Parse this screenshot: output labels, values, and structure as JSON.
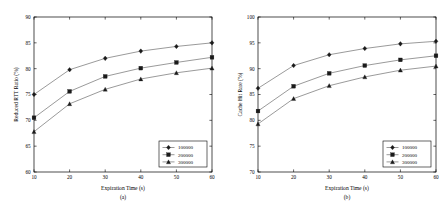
{
  "figure": {
    "panel_count": 2,
    "background": "#ffffff",
    "line_color": "#555555",
    "marker_color": "#1a1a1a",
    "axis_color": "#000000"
  },
  "chart_data": [
    {
      "type": "line",
      "panel_id": "a",
      "subcaption": "(a)",
      "title": "",
      "xlabel": "Expiration Time (s)",
      "ylabel": "Reduced RTT Ratio (%)",
      "x": [
        10,
        20,
        30,
        40,
        50,
        60
      ],
      "xticks": [
        "10",
        "20",
        "30",
        "40",
        "50",
        "60"
      ],
      "yticks": [
        "60",
        "65",
        "70",
        "75",
        "80",
        "85",
        "90"
      ],
      "xlim": [
        10,
        60
      ],
      "ylim": [
        60,
        90
      ],
      "grid": false,
      "legend_position": "lower right",
      "series": [
        {
          "name": "100000",
          "marker": "diamond",
          "values": [
            75.0,
            79.8,
            82.0,
            83.4,
            84.3,
            85.0
          ]
        },
        {
          "name": "200000",
          "marker": "square",
          "values": [
            70.5,
            75.6,
            78.5,
            80.1,
            81.2,
            82.2
          ]
        },
        {
          "name": "300000",
          "marker": "triangle",
          "values": [
            67.8,
            73.2,
            76.0,
            78.0,
            79.2,
            80.1
          ]
        }
      ]
    },
    {
      "type": "line",
      "panel_id": "b",
      "subcaption": "(b)",
      "title": "",
      "xlabel": "Expiration Time (s)",
      "ylabel": "Cache Hit Rate (%)",
      "x": [
        10,
        20,
        30,
        40,
        50,
        60
      ],
      "xticks": [
        "10",
        "20",
        "30",
        "40",
        "50",
        "60"
      ],
      "yticks": [
        "70",
        "75",
        "80",
        "85",
        "90",
        "95",
        "100"
      ],
      "xlim": [
        10,
        60
      ],
      "ylim": [
        70,
        100
      ],
      "grid": false,
      "legend_position": "lower right",
      "series": [
        {
          "name": "100000",
          "marker": "diamond",
          "values": [
            86.2,
            90.6,
            92.7,
            93.9,
            94.8,
            95.3
          ]
        },
        {
          "name": "200000",
          "marker": "square",
          "values": [
            81.8,
            86.6,
            89.1,
            90.6,
            91.7,
            92.5
          ]
        },
        {
          "name": "300000",
          "marker": "triangle",
          "values": [
            79.3,
            84.2,
            86.7,
            88.4,
            89.7,
            90.5
          ]
        }
      ]
    }
  ]
}
